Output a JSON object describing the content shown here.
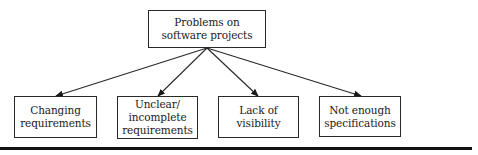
{
  "diagram": {
    "type": "tree",
    "root": {
      "label": "Problems on\nsoftware projects"
    },
    "children": [
      {
        "label": "Changing\nrequirements"
      },
      {
        "label": "Unclear/\nincomplete\nrequirements"
      },
      {
        "label": "Lack of visibility"
      },
      {
        "label": "Not enough\nspecifications"
      }
    ],
    "edges": [
      {
        "from": "root",
        "to": "children.0"
      },
      {
        "from": "root",
        "to": "children.1"
      },
      {
        "from": "root",
        "to": "children.2"
      },
      {
        "from": "root",
        "to": "children.3"
      }
    ],
    "colors": {
      "line": "#2a2a2a",
      "text": "#1a1a1a",
      "background": "#ffffff",
      "rule": "#111111"
    }
  }
}
